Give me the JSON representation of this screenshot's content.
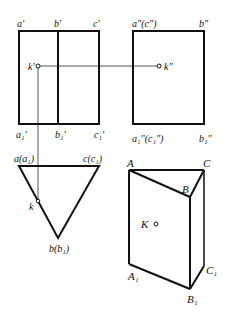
{
  "diagram": {
    "type": "orthographic-projection-triangular-prism",
    "colors": {
      "thick_line": "#111111",
      "projection_line": "#555555",
      "background": "#ffffff"
    },
    "front_view": {
      "labels": {
        "a_top": "a'",
        "b_top": "b'",
        "c_top": "c'",
        "a_bottom": "a₁'",
        "b_bottom": "b₁'",
        "c_bottom": "c₁'",
        "k": "k'"
      }
    },
    "side_view": {
      "labels": {
        "ac_top": "a\"(c\")",
        "b_top": "b\"",
        "ac_bottom": "a₁\"(c₁\")",
        "b_bottom": "b₁\"",
        "k": "k\""
      }
    },
    "top_view": {
      "labels": {
        "a": "a(a₁)",
        "c": "c(c₁)",
        "b": "b(b₁)",
        "k": "k"
      }
    },
    "prism_3d": {
      "labels": {
        "A": "A",
        "B": "B",
        "C": "C",
        "A1": "A₁",
        "B1": "B₁",
        "C1": "C₁",
        "K": "K"
      }
    }
  }
}
